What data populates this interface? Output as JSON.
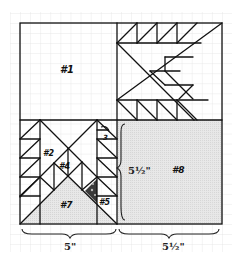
{
  "diagram": {
    "type": "quilt-block-layout",
    "colors": {
      "line": "#111111",
      "grid": "#e4e4e4",
      "shade": "#dcdcdc",
      "dark_piece": "#3a3a3a",
      "background": "#ffffff"
    },
    "quadrants": [
      {
        "id": "top-left",
        "label": "#1",
        "style": "plain"
      },
      {
        "id": "top-right",
        "label": "",
        "style": "flying-geese-arrow"
      },
      {
        "id": "bottom-left",
        "label": "",
        "style": "pieced-x"
      },
      {
        "id": "bottom-right",
        "label": "#8",
        "style": "shaded"
      }
    ],
    "piece_labels": {
      "p1": "#1",
      "p2": "#2",
      "p3": "3",
      "p4": "#4",
      "p5": "#5",
      "p7": "#7",
      "p8": "#8"
    },
    "dimensions": {
      "bottom_left": "5\"",
      "bottom_right": "5½\"",
      "right_vertical": "5½\""
    }
  }
}
